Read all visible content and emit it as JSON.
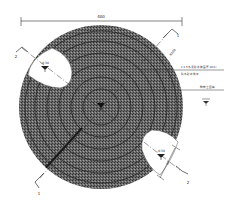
{
  "drawing": {
    "type": "plan view",
    "overall_dimension": "400",
    "outer_radius_dimension": "R200",
    "notch_dimension": "60",
    "section_marks": [
      {
        "id": "1",
        "position": "upper-right"
      },
      {
        "id": "1",
        "position": "lower-left"
      },
      {
        "id": "2",
        "position": "upper-left"
      },
      {
        "id": "2",
        "position": "lower-right"
      }
    ],
    "elevation_marks": [
      {
        "label": "-0.30",
        "position": "upper-left-notch"
      },
      {
        "label": "-0.50",
        "position": "lower-right-notch"
      },
      {
        "label": "",
        "position": "center"
      },
      {
        "label": "",
        "position": "right-legend"
      }
    ],
    "leader_notes": [
      {
        "line1": "1:2.5水泥砂浆抹面 厚20(1)",
        "line2": "防水砂浆找平"
      },
      {
        "line1": "种植土回填",
        "line2": ""
      }
    ],
    "colors": {
      "fill_dark": "#4a4a4a",
      "fill_light": "#8a8a8a",
      "line": "#222222",
      "background": "#ffffff"
    }
  }
}
